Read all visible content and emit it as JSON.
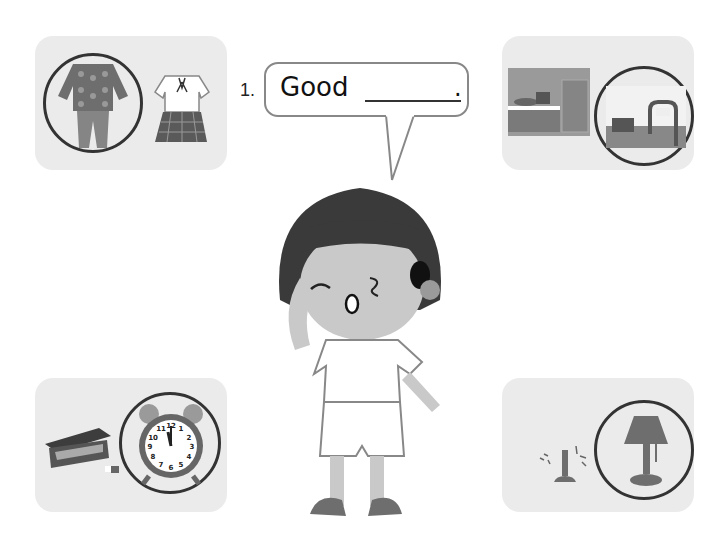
{
  "worksheet": {
    "question_number": "1.",
    "prompt_text": "Good",
    "blank": "________",
    "end_punctuation": "."
  },
  "cards": [
    {
      "position": "top-left",
      "items": [
        "pajamas (circled)",
        "school uniform"
      ]
    },
    {
      "position": "top-right",
      "items": [
        "kitchen",
        "bedroom (circled)"
      ]
    },
    {
      "position": "bottom-left",
      "items": [
        "pencil case",
        "alarm clock 12:00 (circled)"
      ]
    },
    {
      "position": "bottom-right",
      "items": [
        "broken lamp",
        "lamp (circled)"
      ]
    }
  ],
  "clock": {
    "numbers": [
      "12",
      "1",
      "2",
      "3",
      "4",
      "5",
      "6",
      "7",
      "8",
      "9",
      "10",
      "11"
    ]
  },
  "colors": {
    "card_bg": "#ebebeb",
    "ring": "#333333",
    "hair": "#3a3a3a",
    "skin": "#c9c9c9",
    "dark_fill": "#6e6e6e"
  }
}
